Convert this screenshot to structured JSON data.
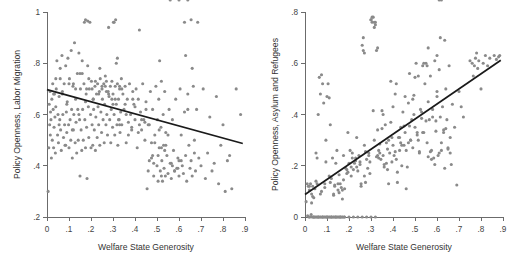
{
  "figure": {
    "background_color": "#ffffff",
    "panel_count": 2,
    "marker_color": "#8a8a8a",
    "line_color": "#1a1a1a",
    "axis_color": "#6b6b6b"
  },
  "chart_data": [
    {
      "type": "scatter",
      "panel": "left",
      "title": "",
      "xlabel": "Welfare State Generosity",
      "ylabel": "Policy Openness, Labor Migration",
      "xlim": [
        0,
        0.9
      ],
      "ylim": [
        0.2,
        1.0
      ],
      "xticks": [
        0,
        0.1,
        0.2,
        0.3,
        0.4,
        0.5,
        0.6,
        0.7,
        0.8,
        0.9
      ],
      "xticklabels": [
        "0",
        ".1",
        ".2",
        ".3",
        ".4",
        ".5",
        ".6",
        ".7",
        ".8",
        ".9"
      ],
      "yticks": [
        0.2,
        0.4,
        0.6,
        0.8,
        1.0
      ],
      "yticklabels": [
        ".2",
        ".4",
        ".6",
        ".8",
        "1"
      ],
      "grid": false,
      "legend": "none",
      "fit_line": {
        "label": "linear fit",
        "x0": 0.0,
        "y0": 0.697,
        "x1": 0.89,
        "y1": 0.487,
        "slope": -0.236,
        "intercept": 0.697
      },
      "n_points": 310,
      "x": [
        0.005,
        0.008,
        0.01,
        0.012,
        0.014,
        0.015,
        0.016,
        0.018,
        0.02,
        0.022,
        0.024,
        0.026,
        0.028,
        0.03,
        0.032,
        0.034,
        0.036,
        0.038,
        0.04,
        0.042,
        0.045,
        0.048,
        0.05,
        0.052,
        0.055,
        0.058,
        0.06,
        0.062,
        0.065,
        0.068,
        0.07,
        0.072,
        0.075,
        0.078,
        0.08,
        0.082,
        0.085,
        0.088,
        0.09,
        0.092,
        0.095,
        0.098,
        0.1,
        0.102,
        0.105,
        0.108,
        0.11,
        0.112,
        0.115,
        0.118,
        0.12,
        0.122,
        0.125,
        0.128,
        0.13,
        0.132,
        0.135,
        0.138,
        0.14,
        0.142,
        0.145,
        0.148,
        0.15,
        0.152,
        0.155,
        0.158,
        0.16,
        0.162,
        0.165,
        0.168,
        0.17,
        0.172,
        0.175,
        0.178,
        0.18,
        0.182,
        0.185,
        0.188,
        0.19,
        0.192,
        0.195,
        0.198,
        0.2,
        0.202,
        0.205,
        0.208,
        0.21,
        0.212,
        0.215,
        0.218,
        0.22,
        0.222,
        0.225,
        0.228,
        0.23,
        0.232,
        0.235,
        0.238,
        0.24,
        0.242,
        0.245,
        0.248,
        0.25,
        0.252,
        0.255,
        0.258,
        0.26,
        0.262,
        0.265,
        0.268,
        0.27,
        0.272,
        0.275,
        0.278,
        0.28,
        0.282,
        0.285,
        0.288,
        0.29,
        0.292,
        0.295,
        0.298,
        0.3,
        0.302,
        0.305,
        0.308,
        0.31,
        0.312,
        0.315,
        0.318,
        0.32,
        0.322,
        0.325,
        0.328,
        0.33,
        0.332,
        0.335,
        0.338,
        0.34,
        0.345,
        0.35,
        0.355,
        0.36,
        0.365,
        0.37,
        0.375,
        0.38,
        0.385,
        0.39,
        0.395,
        0.4,
        0.405,
        0.41,
        0.415,
        0.42,
        0.425,
        0.43,
        0.435,
        0.44,
        0.445,
        0.45,
        0.455,
        0.46,
        0.465,
        0.47,
        0.475,
        0.48,
        0.485,
        0.49,
        0.495,
        0.5,
        0.502,
        0.505,
        0.508,
        0.51,
        0.512,
        0.515,
        0.518,
        0.52,
        0.522,
        0.525,
        0.528,
        0.53,
        0.532,
        0.535,
        0.538,
        0.54,
        0.545,
        0.55,
        0.555,
        0.56,
        0.565,
        0.57,
        0.575,
        0.58,
        0.585,
        0.59,
        0.595,
        0.6,
        0.605,
        0.61,
        0.615,
        0.62,
        0.625,
        0.63,
        0.635,
        0.64,
        0.645,
        0.65,
        0.655,
        0.66,
        0.665,
        0.67,
        0.675,
        0.68,
        0.69,
        0.7,
        0.71,
        0.72,
        0.73,
        0.74,
        0.75,
        0.76,
        0.77,
        0.78,
        0.79,
        0.8,
        0.81,
        0.82,
        0.83,
        0.84,
        0.86,
        0.88,
        0.03,
        0.06,
        0.09,
        0.12,
        0.15,
        0.18,
        0.21,
        0.24,
        0.27,
        0.3,
        0.33,
        0.36,
        0.39,
        0.42,
        0.45,
        0.48,
        0.51,
        0.54,
        0.57,
        0.6,
        0.63,
        0.66,
        0.04,
        0.07,
        0.1,
        0.13,
        0.16,
        0.19,
        0.22,
        0.25,
        0.28,
        0.31,
        0.34,
        0.37,
        0.4,
        0.43,
        0.46,
        0.49,
        0.52,
        0.55,
        0.58,
        0.61,
        0.64,
        0.67,
        0.055,
        0.085,
        0.115,
        0.145,
        0.175,
        0.205,
        0.235,
        0.265,
        0.295,
        0.325,
        0.355,
        0.385,
        0.415,
        0.445,
        0.475,
        0.505,
        0.535,
        0.565,
        0.595,
        0.625,
        0.655,
        0.685,
        0.175,
        0.185,
        0.305,
        0.315,
        0.32,
        0.33,
        0.465,
        0.485,
        0.52,
        0.56,
        0.6,
        0.64
      ],
      "y": [
        0.3,
        0.47,
        0.64,
        0.56,
        0.69,
        0.52,
        0.61,
        0.58,
        0.43,
        0.66,
        0.5,
        0.72,
        0.62,
        0.47,
        0.55,
        0.68,
        0.59,
        0.45,
        0.63,
        0.7,
        0.81,
        0.52,
        0.6,
        0.49,
        0.67,
        0.58,
        0.78,
        0.54,
        0.46,
        0.83,
        0.69,
        0.6,
        0.51,
        0.72,
        0.56,
        0.48,
        0.79,
        0.61,
        0.53,
        0.65,
        0.82,
        0.56,
        0.47,
        0.74,
        0.58,
        0.5,
        0.85,
        0.62,
        0.43,
        0.71,
        0.54,
        0.6,
        0.88,
        0.49,
        0.66,
        0.57,
        0.45,
        0.76,
        0.62,
        0.5,
        0.84,
        0.58,
        0.36,
        0.7,
        0.54,
        0.46,
        0.81,
        0.62,
        0.5,
        0.72,
        0.96,
        0.58,
        0.47,
        0.68,
        0.55,
        0.35,
        0.79,
        0.63,
        0.51,
        0.7,
        0.96,
        0.6,
        0.47,
        0.73,
        0.56,
        0.48,
        0.66,
        0.62,
        0.54,
        0.71,
        0.46,
        0.59,
        0.68,
        0.51,
        0.72,
        0.63,
        0.56,
        0.69,
        0.48,
        0.74,
        0.61,
        0.53,
        0.7,
        0.66,
        0.58,
        0.72,
        0.49,
        0.64,
        0.71,
        0.56,
        0.73,
        0.6,
        0.52,
        0.69,
        0.94,
        0.67,
        0.58,
        0.71,
        0.49,
        0.62,
        0.73,
        0.55,
        0.68,
        0.96,
        0.6,
        0.52,
        0.71,
        0.97,
        0.64,
        0.56,
        0.72,
        0.48,
        0.66,
        0.58,
        0.7,
        0.53,
        0.61,
        0.74,
        0.56,
        0.68,
        0.62,
        0.71,
        0.49,
        0.66,
        0.57,
        0.72,
        0.6,
        0.54,
        0.69,
        0.64,
        0.58,
        0.7,
        0.47,
        0.66,
        0.93,
        0.61,
        0.54,
        0.72,
        0.58,
        0.5,
        0.65,
        0.31,
        0.38,
        0.56,
        0.69,
        0.43,
        0.62,
        0.36,
        0.52,
        0.71,
        0.4,
        0.58,
        0.34,
        0.66,
        0.47,
        0.81,
        0.38,
        0.55,
        0.73,
        0.42,
        0.34,
        0.6,
        0.48,
        0.39,
        0.69,
        0.36,
        0.53,
        0.44,
        0.37,
        0.62,
        0.41,
        0.35,
        0.58,
        0.46,
        0.38,
        0.66,
        0.39,
        0.43,
        0.36,
        0.7,
        0.52,
        0.4,
        0.37,
        0.61,
        0.44,
        0.34,
        0.68,
        0.48,
        0.39,
        0.42,
        0.36,
        0.71,
        0.45,
        0.38,
        0.62,
        0.43,
        0.4,
        0.7,
        0.35,
        0.45,
        0.59,
        0.38,
        0.41,
        0.67,
        0.33,
        0.48,
        0.56,
        0.3,
        0.42,
        0.44,
        0.31,
        0.7,
        0.6,
        0.68,
        0.74,
        0.64,
        0.72,
        0.76,
        0.7,
        0.66,
        0.78,
        0.69,
        0.64,
        0.71,
        0.6,
        0.66,
        0.56,
        0.62,
        0.44,
        0.54,
        0.48,
        0.4,
        0.42,
        0.83,
        0.78,
        0.74,
        0.68,
        0.72,
        0.7,
        0.76,
        0.74,
        0.73,
        0.71,
        0.68,
        0.66,
        0.7,
        0.52,
        0.63,
        0.58,
        0.56,
        0.49,
        0.47,
        0.52,
        0.38,
        0.42,
        0.62,
        0.5,
        0.56,
        0.48,
        0.54,
        0.6,
        0.65,
        0.7,
        0.68,
        0.75,
        0.66,
        0.58,
        0.64,
        0.55,
        0.53,
        0.57,
        0.49,
        0.44,
        0.46,
        0.41,
        0.39,
        0.96,
        0.97,
        0.96,
        0.97,
        0.965,
        0.96,
        0.8,
        0.82,
        0.56,
        0.42,
        0.41,
        0.36
      ]
    },
    {
      "type": "scatter",
      "panel": "right",
      "title": "",
      "xlabel": "Welfare State Generosity",
      "ylabel": "Policy Openness, Asylum and Refugees",
      "xlim": [
        0,
        0.9
      ],
      "ylim": [
        0,
        0.8
      ],
      "xticks": [
        0,
        0.1,
        0.2,
        0.3,
        0.4,
        0.5,
        0.6,
        0.7,
        0.8,
        0.9
      ],
      "xticklabels": [
        "0",
        ".1",
        ".2",
        ".3",
        ".4",
        ".5",
        ".6",
        ".7",
        ".8",
        ".9"
      ],
      "yticks": [
        0,
        0.2,
        0.4,
        0.6,
        0.8
      ],
      "yticklabels": [
        "0",
        ".2",
        ".4",
        ".6",
        ".8"
      ],
      "grid": false,
      "legend": "none",
      "fit_line": {
        "label": "linear fit",
        "x0": 0.0,
        "y0": 0.088,
        "x1": 0.89,
        "y1": 0.612,
        "slope": 0.589,
        "intercept": 0.088
      },
      "n_points": 312,
      "x": [
        0.005,
        0.01,
        0.012,
        0.015,
        0.018,
        0.02,
        0.022,
        0.025,
        0.028,
        0.03,
        0.032,
        0.035,
        0.038,
        0.04,
        0.042,
        0.045,
        0.048,
        0.05,
        0.052,
        0.055,
        0.058,
        0.06,
        0.062,
        0.065,
        0.068,
        0.07,
        0.072,
        0.075,
        0.078,
        0.08,
        0.082,
        0.085,
        0.088,
        0.09,
        0.092,
        0.095,
        0.098,
        0.1,
        0.102,
        0.105,
        0.108,
        0.11,
        0.112,
        0.115,
        0.118,
        0.12,
        0.122,
        0.125,
        0.128,
        0.13,
        0.132,
        0.135,
        0.138,
        0.14,
        0.142,
        0.145,
        0.148,
        0.15,
        0.152,
        0.155,
        0.158,
        0.16,
        0.162,
        0.165,
        0.168,
        0.17,
        0.172,
        0.175,
        0.178,
        0.18,
        0.185,
        0.19,
        0.195,
        0.2,
        0.205,
        0.21,
        0.215,
        0.22,
        0.225,
        0.23,
        0.235,
        0.24,
        0.245,
        0.25,
        0.255,
        0.26,
        0.265,
        0.27,
        0.275,
        0.28,
        0.285,
        0.29,
        0.295,
        0.3,
        0.305,
        0.31,
        0.315,
        0.32,
        0.325,
        0.33,
        0.335,
        0.34,
        0.345,
        0.35,
        0.355,
        0.36,
        0.365,
        0.37,
        0.375,
        0.38,
        0.385,
        0.39,
        0.395,
        0.4,
        0.405,
        0.41,
        0.415,
        0.42,
        0.425,
        0.43,
        0.435,
        0.44,
        0.445,
        0.45,
        0.455,
        0.46,
        0.465,
        0.47,
        0.475,
        0.48,
        0.485,
        0.49,
        0.495,
        0.5,
        0.505,
        0.51,
        0.515,
        0.52,
        0.525,
        0.53,
        0.535,
        0.54,
        0.545,
        0.55,
        0.555,
        0.56,
        0.565,
        0.57,
        0.575,
        0.58,
        0.585,
        0.59,
        0.595,
        0.6,
        0.605,
        0.61,
        0.615,
        0.62,
        0.625,
        0.63,
        0.635,
        0.64,
        0.645,
        0.65,
        0.655,
        0.66,
        0.665,
        0.67,
        0.68,
        0.69,
        0.7,
        0.71,
        0.72,
        0.75,
        0.76,
        0.765,
        0.77,
        0.775,
        0.78,
        0.785,
        0.79,
        0.8,
        0.81,
        0.82,
        0.83,
        0.84,
        0.86,
        0.87,
        0.88,
        0.885,
        0.03,
        0.05,
        0.07,
        0.09,
        0.11,
        0.13,
        0.15,
        0.17,
        0.19,
        0.21,
        0.23,
        0.25,
        0.27,
        0.29,
        0.31,
        0.33,
        0.35,
        0.37,
        0.39,
        0.41,
        0.43,
        0.45,
        0.47,
        0.49,
        0.51,
        0.53,
        0.55,
        0.57,
        0.59,
        0.61,
        0.63,
        0.65,
        0.04,
        0.06,
        0.08,
        0.1,
        0.12,
        0.14,
        0.16,
        0.18,
        0.2,
        0.22,
        0.24,
        0.26,
        0.28,
        0.3,
        0.32,
        0.34,
        0.36,
        0.38,
        0.4,
        0.42,
        0.44,
        0.46,
        0.48,
        0.5,
        0.52,
        0.54,
        0.56,
        0.58,
        0.6,
        0.62,
        0.64,
        0.66,
        0.02,
        0.035,
        0.055,
        0.075,
        0.095,
        0.115,
        0.135,
        0.155,
        0.175,
        0.195,
        0.215,
        0.235,
        0.255,
        0.275,
        0.295,
        0.315,
        0.335,
        0.355,
        0.375,
        0.395,
        0.415,
        0.435,
        0.455,
        0.475,
        0.495,
        0.515,
        0.535,
        0.555,
        0.575,
        0.595,
        0.615,
        0.635,
        0.3,
        0.305,
        0.315,
        0.32,
        0.325,
        0.33,
        0.265,
        0.27,
        0.56,
        0.6,
        0.61,
        0.62
      ],
      "y": [
        0.06,
        0.13,
        0.005,
        0.12,
        0.0,
        0.105,
        0.0,
        0.13,
        0.01,
        0.09,
        0.0,
        0.12,
        0.0,
        0.075,
        0.0,
        0.11,
        0.0,
        0.25,
        0.0,
        0.23,
        0.0,
        0.4,
        0.0,
        0.545,
        0.0,
        0.48,
        0.0,
        0.555,
        0.0,
        0.52,
        0.0,
        0.445,
        0.0,
        0.13,
        0.0,
        0.3,
        0.0,
        0.47,
        0.0,
        0.52,
        0.0,
        0.16,
        0.0,
        0.36,
        0.0,
        0.15,
        0.0,
        0.23,
        0.0,
        0.09,
        0.0,
        0.12,
        0.0,
        0.21,
        0.0,
        0.26,
        0.0,
        0.105,
        0.0,
        0.095,
        0.0,
        0.13,
        0.0,
        0.115,
        0.0,
        0.07,
        0.0,
        0.24,
        0.0,
        0.11,
        0.19,
        0.17,
        0.33,
        0.21,
        0.26,
        0.195,
        0.25,
        0.185,
        0.21,
        0.23,
        0.31,
        0.18,
        0.24,
        0.205,
        0.12,
        0.67,
        0.65,
        0.28,
        0.135,
        0.225,
        0.19,
        0.24,
        0.215,
        0.77,
        0.76,
        0.78,
        0.74,
        0.76,
        0.235,
        0.34,
        0.26,
        0.285,
        0.225,
        0.415,
        0.24,
        0.195,
        0.36,
        0.21,
        0.185,
        0.3,
        0.25,
        0.53,
        0.215,
        0.28,
        0.24,
        0.48,
        0.225,
        0.135,
        0.31,
        0.26,
        0.35,
        0.2,
        0.41,
        0.28,
        0.33,
        0.26,
        0.195,
        0.445,
        0.56,
        0.3,
        0.38,
        0.27,
        0.475,
        0.35,
        0.6,
        0.32,
        0.55,
        0.25,
        0.42,
        0.385,
        0.59,
        0.33,
        0.52,
        0.6,
        0.29,
        0.45,
        0.38,
        0.55,
        0.26,
        0.42,
        0.23,
        0.61,
        0.335,
        0.49,
        0.24,
        0.575,
        0.39,
        0.26,
        0.43,
        0.34,
        0.19,
        0.5,
        0.38,
        0.265,
        0.59,
        0.31,
        0.205,
        0.44,
        0.35,
        0.125,
        0.49,
        0.43,
        0.39,
        0.61,
        0.6,
        0.55,
        0.59,
        0.62,
        0.64,
        0.58,
        0.61,
        0.5,
        0.6,
        0.63,
        0.59,
        0.62,
        0.63,
        0.615,
        0.625,
        0.63,
        0.055,
        0.14,
        0.09,
        0.115,
        0.465,
        0.085,
        0.13,
        0.105,
        0.185,
        0.16,
        0.22,
        0.215,
        0.16,
        0.25,
        0.415,
        0.24,
        0.345,
        0.29,
        0.37,
        0.255,
        0.31,
        0.355,
        0.29,
        0.46,
        0.33,
        0.41,
        0.375,
        0.255,
        0.205,
        0.25,
        0.33,
        0.27,
        0.0,
        0.0,
        0.0,
        0.0,
        0.0,
        0.0,
        0.0,
        0.0,
        0.0,
        0.0,
        0.0,
        0.0,
        0.0,
        0.0,
        0.0,
        0.25,
        0.205,
        0.13,
        0.43,
        0.175,
        0.28,
        0.11,
        0.3,
        0.545,
        0.255,
        0.6,
        0.235,
        0.39,
        0.47,
        0.29,
        0.345,
        0.25,
        0.12,
        0.08,
        0.13,
        0.1,
        0.215,
        0.135,
        0.125,
        0.165,
        0.145,
        0.175,
        0.23,
        0.195,
        0.13,
        0.255,
        0.17,
        0.3,
        0.23,
        0.4,
        0.265,
        0.31,
        0.52,
        0.29,
        0.47,
        0.355,
        0.4,
        0.3,
        0.33,
        0.59,
        0.225,
        0.375,
        0.7,
        0.69,
        0.77,
        0.78,
        0.76,
        0.75,
        0.65,
        0.66,
        0.7,
        0.64,
        0.66,
        0.63
      ]
    }
  ]
}
